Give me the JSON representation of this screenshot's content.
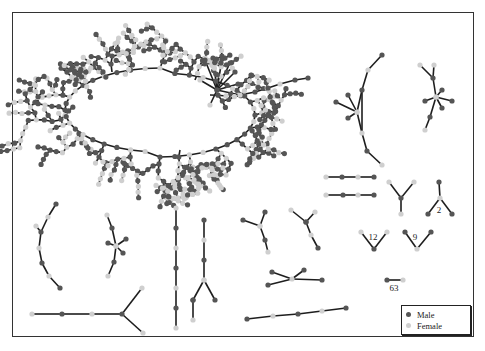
{
  "figure": {
    "type": "network-diagram",
    "colors": {
      "male": "#555555",
      "female": "#cfcfcf",
      "edge": "#1e1e1e",
      "border": "#333333"
    }
  },
  "legend": {
    "items": [
      {
        "label": "Male",
        "color": "#555555"
      },
      {
        "label": "Female",
        "color": "#cfcfcf"
      }
    ]
  },
  "component_labels": [
    {
      "text": "2",
      "x": 439,
      "y": 213
    },
    {
      "text": "12",
      "x": 373,
      "y": 240
    },
    {
      "text": "9",
      "x": 415,
      "y": 240
    },
    {
      "text": "63",
      "x": 394,
      "y": 291
    }
  ]
}
